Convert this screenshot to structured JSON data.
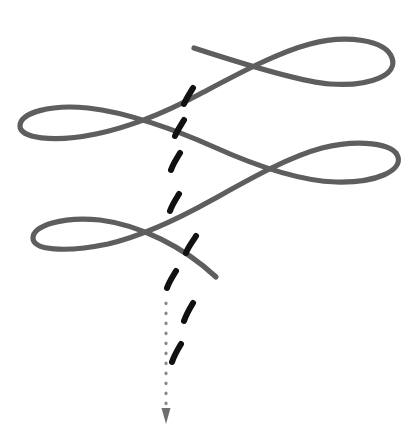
{
  "figure": {
    "title": "Sinusoidal wave path with descending dashed trajectory",
    "width": 418,
    "height": 446,
    "background_color": "#ffffff",
    "elements": {
      "wave_curve": {
        "name": "looping-sinusoidal-curve",
        "description": "Continuous gray ribbon curve forming three elongated loops descending left-to-right and top-to-bottom, with free ends at upper-left-center and lower-center",
        "stroke_color": "#5e5e5e",
        "stroke_width": 5.2,
        "loop_count": 3,
        "free_end_start": [
          194,
          48
        ],
        "free_end_finish": [
          216,
          277
        ],
        "crossings": [
          [
            266,
            70
          ],
          [
            148,
            133
          ],
          [
            281,
            176
          ],
          [
            168,
            243
          ]
        ],
        "loop_tips_right": [
          [
            392,
            57
          ],
          [
            400,
            174
          ]
        ],
        "loop_tips_left": [
          [
            20,
            126
          ],
          [
            33,
            248
          ]
        ]
      },
      "dashed_marks": {
        "name": "black-dash-trail",
        "description": "Series of eight short thick black comma-like dashes descending roughly vertically through the center of the figure",
        "color": "#111111",
        "count": 8,
        "positions": [
          [
            189,
            95
          ],
          [
            179,
            128
          ],
          [
            176,
            161
          ],
          [
            175,
            202
          ],
          [
            191,
            244
          ],
          [
            172,
            279
          ],
          [
            189,
            312
          ],
          [
            177,
            352
          ]
        ]
      },
      "dotted_arrow": {
        "name": "downward-dotted-arrow",
        "description": "Vertical dotted gray line terminating in a small downward-pointing arrowhead",
        "color": "#8a8a8a",
        "x": 166,
        "y_start": 303,
        "y_end": 418,
        "dot_radius": 1.6,
        "dot_spacing": 10,
        "arrowhead": {
          "tip": [
            166,
            424
          ],
          "width": 9,
          "height": 16,
          "color": "#6f6f6f"
        }
      }
    }
  }
}
